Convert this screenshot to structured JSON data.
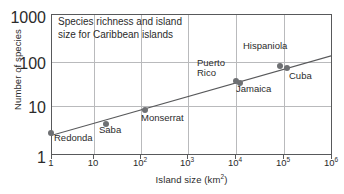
{
  "chart_data": {
    "type": "scatter",
    "title": "Species richness and island size for Caribbean islands",
    "title_line1": "Species richness and island",
    "title_line2": "size for Caribbean islands",
    "xlabel": "Island size (km²)",
    "xlabel_text": "Island size (km",
    "xlabel_sup": "2",
    "xlabel_close": ")",
    "ylabel": "Number of species",
    "xscale": "log",
    "yscale": "log",
    "xlim": [
      1,
      1000000
    ],
    "ylim": [
      1,
      1000
    ],
    "grid": true,
    "legend": "none",
    "xticks": [
      {
        "value": 1,
        "label": "1",
        "sup": ""
      },
      {
        "value": 10,
        "label": "10",
        "sup": ""
      },
      {
        "value": 100,
        "label": "10",
        "sup": "2"
      },
      {
        "value": 1000,
        "label": "10",
        "sup": "3"
      },
      {
        "value": 10000,
        "label": "10",
        "sup": "4"
      },
      {
        "value": 100000,
        "label": "10",
        "sup": "5"
      },
      {
        "value": 1000000,
        "label": "10",
        "sup": "6"
      }
    ],
    "yticks": [
      {
        "value": 1000,
        "label": "1000"
      },
      {
        "value": 100,
        "label": "100"
      },
      {
        "value": 10,
        "label": "10"
      },
      {
        "value": 1,
        "label": "1"
      }
    ],
    "point_color": "#6e7073",
    "line_color": "#58595b",
    "grid_color": "#b9babc",
    "axis_color": "#58595b",
    "points": [
      {
        "name": "Redonda",
        "x": 1,
        "y": 3
      },
      {
        "name": "Saba",
        "x": 15,
        "y": 4.5
      },
      {
        "name": "Monserrat",
        "x": 100,
        "y": 9
      },
      {
        "name": "Puerto Rico",
        "x": 9000,
        "y": 38
      },
      {
        "name": "Jamaica",
        "x": 11000,
        "y": 34
      },
      {
        "name": "Hispaniola",
        "x": 76000,
        "y": 80
      },
      {
        "name": "Cuba",
        "x": 110000,
        "y": 70
      }
    ],
    "point_labels": [
      {
        "text": "Redonda",
        "for": "Redonda"
      },
      {
        "text": "Saba",
        "for": "Saba"
      },
      {
        "text": "Monserrat",
        "for": "Monserrat"
      },
      {
        "text": "Puerto",
        "for": "Puerto Rico"
      },
      {
        "text": "Rico",
        "for": "Puerto Rico"
      },
      {
        "text": "Jamaica",
        "for": "Jamaica"
      },
      {
        "text": "Hispaniola",
        "for": "Hispaniola"
      },
      {
        "text": "Cuba",
        "for": "Cuba"
      }
    ],
    "trendline": {
      "x_start": 1,
      "y_start": 2.6,
      "x_end": 1000000,
      "y_end": 130
    }
  }
}
